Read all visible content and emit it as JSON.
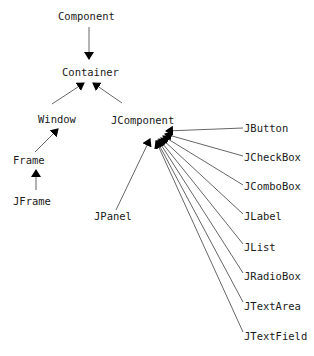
{
  "diagram": {
    "type": "class-hierarchy",
    "nodes": {
      "component": "Component",
      "container": "Container",
      "window": "Window",
      "jcomponent": "JComponent",
      "frame": "Frame",
      "jframe": "JFrame",
      "jpanel": "JPanel",
      "jbutton": "JButton",
      "jcheckbox": "JCheckBox",
      "jcombobox": "JComboBox",
      "jlabel": "JLabel",
      "jlist": "JList",
      "jradiobox": "JRadioBox",
      "jtextarea": "JTextArea",
      "jtextfield": "JTextField"
    },
    "edges": [
      {
        "from": "Component",
        "to": "Container"
      },
      {
        "from": "Window",
        "to": "Container"
      },
      {
        "from": "JComponent",
        "to": "Container"
      },
      {
        "from": "Frame",
        "to": "Window"
      },
      {
        "from": "JFrame",
        "to": "Frame"
      },
      {
        "from": "JPanel",
        "to": "JComponent"
      },
      {
        "from": "JButton",
        "to": "JComponent"
      },
      {
        "from": "JCheckBox",
        "to": "JComponent"
      },
      {
        "from": "JComboBox",
        "to": "JComponent"
      },
      {
        "from": "JLabel",
        "to": "JComponent"
      },
      {
        "from": "JList",
        "to": "JComponent"
      },
      {
        "from": "JRadioBox",
        "to": "JComponent"
      },
      {
        "from": "JTextArea",
        "to": "JComponent"
      },
      {
        "from": "JTextField",
        "to": "JComponent"
      }
    ],
    "colors": {
      "text": "#1a1a1a",
      "line": "#555555",
      "arrowhead": "#000000",
      "background": "#ffffff"
    }
  }
}
